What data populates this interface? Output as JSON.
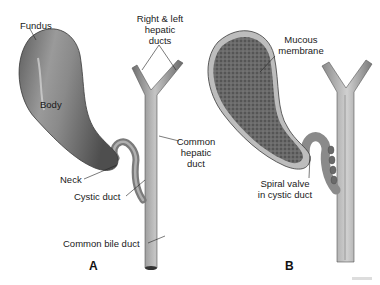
{
  "figure": {
    "panels": [
      {
        "id": "A",
        "letter": "A",
        "view": "external",
        "labels": {
          "fundus": "Fundus",
          "body": "Body",
          "neck": "Neck",
          "cystic_duct": "Cystic duct",
          "hepatic_ducts_line1": "Right & left",
          "hepatic_ducts_line2": "hepatic",
          "hepatic_ducts_line3": "ducts",
          "common_hepatic_line1": "Common",
          "common_hepatic_line2": "hepatic",
          "common_hepatic_line3": "duct",
          "common_bile_duct": "Common bile duct"
        }
      },
      {
        "id": "B",
        "letter": "B",
        "view": "sectioned",
        "labels": {
          "mucous_line1": "Mucous",
          "mucous_line2": "membrane",
          "spiral_line1": "Spiral valve",
          "spiral_line2": "in cystic duct"
        }
      }
    ],
    "colors": {
      "organ_fill": "#7d7d7d",
      "organ_highlight": "#b5b5b5",
      "duct_fill": "#a9a9a9",
      "mucosa_fill": "#5a5a5a",
      "text": "#1a1a1a",
      "background": "#ffffff"
    }
  }
}
